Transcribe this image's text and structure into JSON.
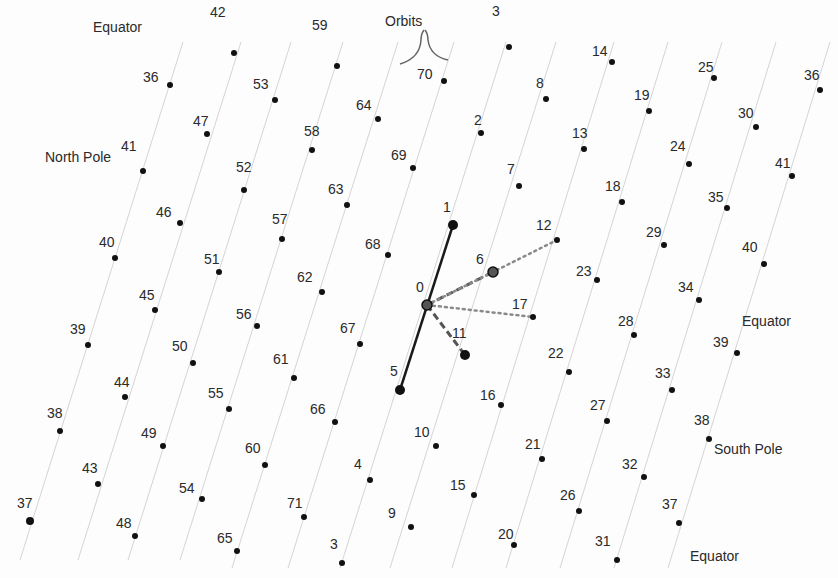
{
  "diagram": {
    "annotations": {
      "orbits": "Orbits",
      "equator_top_left": "Equator",
      "north_pole": "North Pole",
      "equator_right": "Equator",
      "south_pole": "South Pole",
      "equator_bottom_right": "Equator"
    },
    "colors": {
      "dot": "#111111",
      "orbit_line": "#d4d4d4",
      "solid_edge": "#1a1a1a",
      "dashed_edge": "#555555",
      "dotted_edge": "#8a8a8a",
      "text": "#2a2a2a"
    },
    "points": [
      {
        "id": "0",
        "x": 427,
        "y": 305,
        "r": 5,
        "lx": 416,
        "ly": 280,
        "hollow": true
      },
      {
        "id": "1",
        "x": 453,
        "y": 225,
        "r": 5,
        "lx": 443,
        "ly": 200
      },
      {
        "id": "2",
        "x": 481,
        "y": 133,
        "r": 3,
        "lx": 474,
        "ly": 113
      },
      {
        "id": "3",
        "x": 509,
        "y": 47,
        "r": 3,
        "lx": 492,
        "ly": 4
      },
      {
        "id": "5",
        "x": 400,
        "y": 390,
        "r": 5,
        "lx": 390,
        "ly": 364
      },
      {
        "id": "6",
        "x": 493,
        "y": 272,
        "r": 5,
        "lx": 476,
        "ly": 252,
        "hollow": true
      },
      {
        "id": "7",
        "x": 519,
        "y": 186,
        "r": 3,
        "lx": 507,
        "ly": 162
      },
      {
        "id": "8",
        "x": 546,
        "y": 99,
        "r": 3,
        "lx": 536,
        "ly": 76
      },
      {
        "id": "11",
        "x": 465,
        "y": 355,
        "r": 5,
        "lx": 452,
        "ly": 326
      },
      {
        "id": "12",
        "x": 557,
        "y": 240,
        "r": 3,
        "lx": 536,
        "ly": 218
      },
      {
        "id": "13",
        "x": 584,
        "y": 149,
        "r": 3,
        "lx": 572,
        "ly": 126
      },
      {
        "id": "14",
        "x": 612,
        "y": 62,
        "r": 3,
        "lx": 592,
        "ly": 44
      },
      {
        "id": "17",
        "x": 533,
        "y": 317,
        "r": 3,
        "lx": 512,
        "ly": 297
      },
      {
        "id": "18",
        "x": 622,
        "y": 202,
        "r": 3,
        "lx": 605,
        "ly": 179
      },
      {
        "id": "19",
        "x": 649,
        "y": 111,
        "r": 3,
        "lx": 634,
        "ly": 88
      },
      {
        "id": "22",
        "x": 569,
        "y": 372,
        "r": 3,
        "lx": 548,
        "ly": 346
      },
      {
        "id": "23",
        "x": 597,
        "y": 280,
        "r": 3,
        "lx": 576,
        "ly": 264
      },
      {
        "id": "24",
        "x": 689,
        "y": 164,
        "r": 3,
        "lx": 670,
        "ly": 139
      },
      {
        "id": "25",
        "x": 714,
        "y": 78,
        "r": 3,
        "lx": 698,
        "ly": 60
      },
      {
        "id": "26",
        "x": 579,
        "y": 511,
        "r": 3,
        "lx": 560,
        "ly": 488
      },
      {
        "id": "27",
        "x": 607,
        "y": 421,
        "r": 3,
        "lx": 590,
        "ly": 398
      },
      {
        "id": "28",
        "x": 634,
        "y": 335,
        "r": 3,
        "lx": 618,
        "ly": 314
      },
      {
        "id": "29",
        "x": 664,
        "y": 245,
        "r": 3,
        "lx": 646,
        "ly": 225
      },
      {
        "id": "30",
        "x": 756,
        "y": 127,
        "r": 3,
        "lx": 738,
        "ly": 106
      },
      {
        "id": "31",
        "x": 617,
        "y": 560,
        "r": 3,
        "lx": 595,
        "ly": 534
      },
      {
        "id": "32",
        "x": 644,
        "y": 477,
        "r": 3,
        "lx": 622,
        "ly": 457
      },
      {
        "id": "33",
        "x": 672,
        "y": 390,
        "r": 3,
        "lx": 655,
        "ly": 366
      },
      {
        "id": "34",
        "x": 699,
        "y": 300,
        "r": 3,
        "lx": 678,
        "ly": 280
      },
      {
        "id": "35",
        "x": 727,
        "y": 208,
        "r": 3,
        "lx": 708,
        "ly": 190
      },
      {
        "id": "36",
        "x": 820,
        "y": 90,
        "r": 3,
        "lx": 804,
        "ly": 68
      },
      {
        "id": "37",
        "x": 679,
        "y": 523,
        "r": 3,
        "lx": 662,
        "ly": 497
      },
      {
        "id": "38",
        "x": 709,
        "y": 439,
        "r": 3,
        "lx": 694,
        "ly": 413
      },
      {
        "id": "39",
        "x": 737,
        "y": 353,
        "r": 3,
        "lx": 713,
        "ly": 335
      },
      {
        "id": "40",
        "x": 764,
        "y": 264,
        "r": 3,
        "lx": 742,
        "ly": 240
      },
      {
        "id": "41",
        "x": 792,
        "y": 176,
        "r": 3,
        "lx": 775,
        "ly": 156
      },
      {
        "id": "4",
        "x": 370,
        "y": 480,
        "r": 3,
        "lx": 354,
        "ly": 457
      },
      {
        "id": "9",
        "x": 411,
        "y": 527,
        "r": 3,
        "lx": 388,
        "ly": 506
      },
      {
        "id": "3b",
        "label": "3",
        "x": 342,
        "y": 563,
        "r": 3,
        "lx": 330,
        "ly": 537
      },
      {
        "id": "10",
        "x": 436,
        "y": 446,
        "r": 3,
        "lx": 414,
        "ly": 425
      },
      {
        "id": "15",
        "x": 474,
        "y": 495,
        "r": 3,
        "lx": 450,
        "ly": 478
      },
      {
        "id": "16",
        "x": 501,
        "y": 405,
        "r": 3,
        "lx": 480,
        "ly": 388
      },
      {
        "id": "20",
        "x": 514,
        "y": 545,
        "r": 3,
        "lx": 498,
        "ly": 527
      },
      {
        "id": "21",
        "x": 542,
        "y": 459,
        "r": 3,
        "lx": 525,
        "ly": 437
      },
      {
        "id": "36b",
        "label": "36",
        "x": 170,
        "y": 85,
        "r": 3,
        "lx": 143,
        "ly": 70
      },
      {
        "id": "37b",
        "label": "37",
        "x": 30,
        "y": 521,
        "r": 4,
        "lx": 17,
        "ly": 496
      },
      {
        "id": "38b",
        "label": "38",
        "x": 60,
        "y": 431,
        "r": 3,
        "lx": 47,
        "ly": 406
      },
      {
        "id": "39b",
        "label": "39",
        "x": 88,
        "y": 345,
        "r": 3,
        "lx": 70,
        "ly": 322
      },
      {
        "id": "40b",
        "label": "40",
        "x": 115,
        "y": 258,
        "r": 3,
        "lx": 99,
        "ly": 235
      },
      {
        "id": "41b",
        "label": "41",
        "x": 143,
        "y": 171,
        "r": 3,
        "lx": 121,
        "ly": 139
      },
      {
        "id": "42",
        "x": 234,
        "y": 53,
        "r": 3,
        "lx": 210,
        "ly": 5
      },
      {
        "id": "43",
        "x": 98,
        "y": 484,
        "r": 3,
        "lx": 82,
        "ly": 461
      },
      {
        "id": "44",
        "x": 125,
        "y": 397,
        "r": 3,
        "lx": 114,
        "ly": 375
      },
      {
        "id": "45",
        "x": 155,
        "y": 310,
        "r": 3,
        "lx": 139,
        "ly": 288
      },
      {
        "id": "46",
        "x": 180,
        "y": 223,
        "r": 3,
        "lx": 156,
        "ly": 205
      },
      {
        "id": "47",
        "x": 207,
        "y": 134,
        "r": 3,
        "lx": 193,
        "ly": 114
      },
      {
        "id": "48",
        "x": 135,
        "y": 536,
        "r": 3,
        "lx": 116,
        "ly": 516
      },
      {
        "id": "49",
        "x": 163,
        "y": 446,
        "r": 3,
        "lx": 141,
        "ly": 426
      },
      {
        "id": "50",
        "x": 193,
        "y": 363,
        "r": 3,
        "lx": 172,
        "ly": 339
      },
      {
        "id": "51",
        "x": 219,
        "y": 272,
        "r": 3,
        "lx": 204,
        "ly": 252
      },
      {
        "id": "52",
        "x": 244,
        "y": 190,
        "r": 3,
        "lx": 236,
        "ly": 160
      },
      {
        "id": "53",
        "x": 275,
        "y": 100,
        "r": 3,
        "lx": 253,
        "ly": 77
      },
      {
        "id": "54",
        "x": 202,
        "y": 499,
        "r": 3,
        "lx": 179,
        "ly": 481
      },
      {
        "id": "55",
        "x": 229,
        "y": 409,
        "r": 3,
        "lx": 208,
        "ly": 386
      },
      {
        "id": "56",
        "x": 257,
        "y": 326,
        "r": 3,
        "lx": 236,
        "ly": 307
      },
      {
        "id": "57",
        "x": 282,
        "y": 239,
        "r": 3,
        "lx": 272,
        "ly": 212
      },
      {
        "id": "58",
        "x": 312,
        "y": 150,
        "r": 3,
        "lx": 304,
        "ly": 124
      },
      {
        "id": "59",
        "x": 337,
        "y": 66,
        "r": 3,
        "lx": 312,
        "ly": 18
      },
      {
        "id": "60",
        "x": 265,
        "y": 465,
        "r": 3,
        "lx": 245,
        "ly": 441
      },
      {
        "id": "61",
        "x": 294,
        "y": 378,
        "r": 3,
        "lx": 273,
        "ly": 352
      },
      {
        "id": "62",
        "x": 322,
        "y": 292,
        "r": 3,
        "lx": 297,
        "ly": 270
      },
      {
        "id": "63",
        "x": 347,
        "y": 205,
        "r": 3,
        "lx": 328,
        "ly": 182
      },
      {
        "id": "64",
        "x": 378,
        "y": 119,
        "r": 3,
        "lx": 356,
        "ly": 98
      },
      {
        "id": "65",
        "x": 237,
        "y": 551,
        "r": 3,
        "lx": 217,
        "ly": 531
      },
      {
        "id": "66",
        "x": 335,
        "y": 422,
        "r": 3,
        "lx": 310,
        "ly": 402
      },
      {
        "id": "67",
        "x": 360,
        "y": 344,
        "r": 3,
        "lx": 340,
        "ly": 321
      },
      {
        "id": "68",
        "x": 388,
        "y": 255,
        "r": 3,
        "lx": 365,
        "ly": 237
      },
      {
        "id": "69",
        "x": 413,
        "y": 168,
        "r": 3,
        "lx": 391,
        "ly": 148
      },
      {
        "id": "70",
        "x": 444,
        "y": 81,
        "r": 3,
        "lx": 417,
        "ly": 67
      },
      {
        "id": "71",
        "x": 304,
        "y": 517,
        "r": 3,
        "lx": 287,
        "ly": 496
      }
    ],
    "orbit_lines": [
      {
        "x1": 20,
        "y1": 560,
        "x2": 183,
        "y2": 42
      },
      {
        "x1": 78,
        "y1": 560,
        "x2": 241,
        "y2": 42
      },
      {
        "x1": 128,
        "y1": 560,
        "x2": 291,
        "y2": 42
      },
      {
        "x1": 180,
        "y1": 560,
        "x2": 343,
        "y2": 42
      },
      {
        "x1": 232,
        "y1": 568,
        "x2": 398,
        "y2": 42
      },
      {
        "x1": 288,
        "y1": 568,
        "x2": 454,
        "y2": 42
      },
      {
        "x1": 340,
        "y1": 568,
        "x2": 506,
        "y2": 42
      },
      {
        "x1": 390,
        "y1": 568,
        "x2": 556,
        "y2": 42
      },
      {
        "x1": 452,
        "y1": 568,
        "x2": 614,
        "y2": 42
      },
      {
        "x1": 506,
        "y1": 568,
        "x2": 668,
        "y2": 42
      },
      {
        "x1": 560,
        "y1": 568,
        "x2": 722,
        "y2": 42
      },
      {
        "x1": 614,
        "y1": 568,
        "x2": 776,
        "y2": 42
      },
      {
        "x1": 668,
        "y1": 568,
        "x2": 830,
        "y2": 42
      }
    ],
    "edges": [
      {
        "from": "5",
        "to": "1",
        "style": "solid"
      },
      {
        "from": "0",
        "to": "6",
        "style": "dashed"
      },
      {
        "from": "0",
        "to": "11",
        "style": "dashed"
      },
      {
        "from": "0",
        "to": "12",
        "style": "dotted"
      },
      {
        "from": "0",
        "to": "17",
        "style": "dotted"
      }
    ]
  }
}
